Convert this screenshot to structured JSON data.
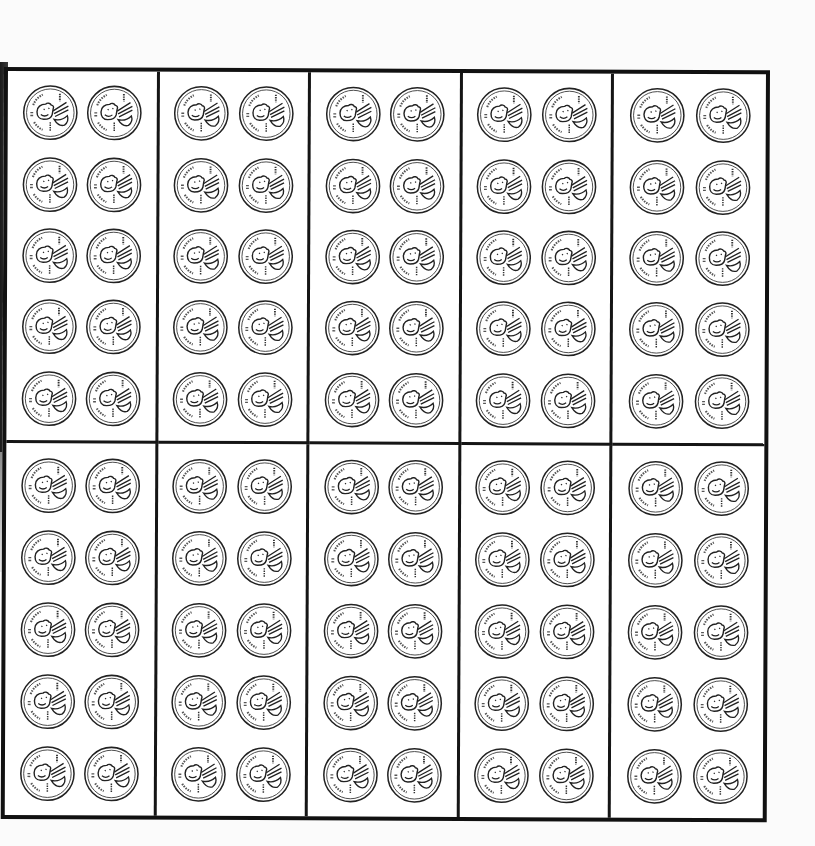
{
  "worksheet": {
    "title": "",
    "layout": {
      "box_rows": 2,
      "box_columns": 5,
      "coins_per_box": 10,
      "coin_rows_per_box": 5,
      "coin_columns_per_box": 2
    },
    "coin": {
      "type": "penny",
      "icon": "penny-icon",
      "value_cents": 1
    },
    "total_coins": 100,
    "colors": {
      "ink": "#111111",
      "paper": "#ffffff",
      "scan_edge": "#1a1a1a"
    }
  },
  "boxes": [
    {
      "id": 1,
      "coins": 10
    },
    {
      "id": 2,
      "coins": 10
    },
    {
      "id": 3,
      "coins": 10
    },
    {
      "id": 4,
      "coins": 10
    },
    {
      "id": 5,
      "coins": 10
    },
    {
      "id": 6,
      "coins": 10
    },
    {
      "id": 7,
      "coins": 10
    },
    {
      "id": 8,
      "coins": 10
    },
    {
      "id": 9,
      "coins": 10
    },
    {
      "id": 10,
      "coins": 10
    }
  ]
}
